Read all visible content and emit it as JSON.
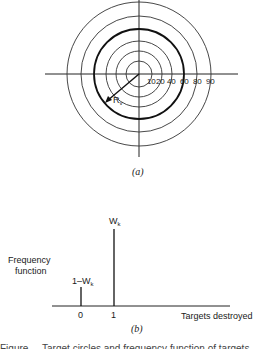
{
  "figure_a": {
    "caption": "(a)",
    "ring_labels": [
      "10",
      "20",
      "40",
      "60",
      "80",
      "90"
    ],
    "radius_label": "R",
    "radius_label_sub": "v",
    "highlighted_ring": "60"
  },
  "figure_b": {
    "caption": "(b)",
    "y_label_line1": "Frequency",
    "y_label_line2": "function",
    "x_label": "Targets destroyed",
    "x_ticks": [
      "0",
      "1"
    ],
    "bar_labels": {
      "zero_prefix": "1–W",
      "zero_sub": "k",
      "one_prefix": "W",
      "one_sub": "k"
    }
  },
  "caption_fragment": "Figure ...  Target circles and frequency function of targets destroyed"
}
